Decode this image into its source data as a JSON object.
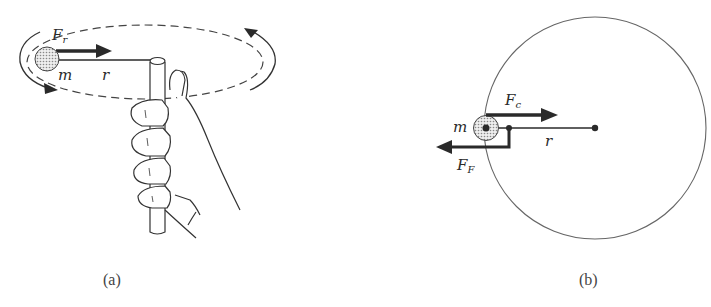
{
  "figure": {
    "panels": [
      {
        "id": "a",
        "caption": "(a)",
        "description": "Hand holding a vertical tube, whirling a mass m on a string of radius r in a horizontal circle",
        "labels": {
          "force": "F",
          "force_subscript": "r",
          "mass": "m",
          "radius": "r"
        },
        "elements": [
          "dashed-orbit-ellipse",
          "rotation-arrows",
          "mass-ball",
          "force-arrow",
          "string",
          "tube",
          "hand"
        ]
      },
      {
        "id": "b",
        "caption": "(b)",
        "description": "Top view: circular path with mass m, centripetal force Fc toward center, and reaction force F_F outward",
        "labels": {
          "centripetal_force": "F",
          "centripetal_force_subscript": "c",
          "reaction_force": "F",
          "reaction_force_subscript": "F",
          "mass": "m",
          "radius": "r"
        },
        "elements": [
          "circle-path",
          "mass-ball",
          "centripetal-arrow",
          "reaction-arrow",
          "string",
          "center-dot"
        ]
      }
    ],
    "colors": {
      "ink": "#2a2a2a",
      "thin_line": "#555555",
      "stipple": "#bdbdbd",
      "background": "#ffffff"
    }
  }
}
